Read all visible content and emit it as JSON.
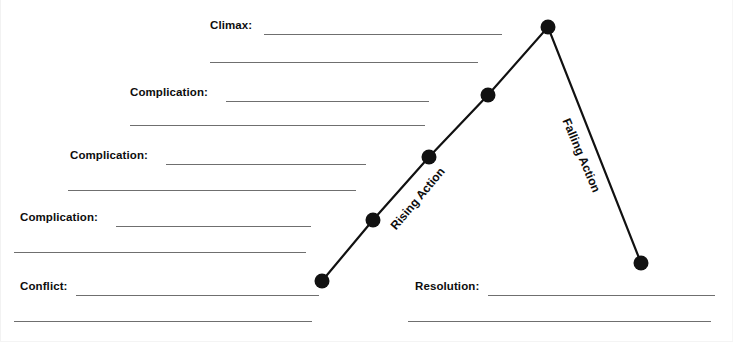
{
  "worksheet": {
    "title": "Plot Diagram Graphic Organizer",
    "background_color": "#ffffff",
    "rule_color": "#6f6f6f",
    "text_color": "#0d0d0d",
    "plot_line_color": "#111111"
  },
  "stages": [
    {
      "id": "climax",
      "label": "Climax:",
      "label_x": 210,
      "label_y": 20,
      "rule1": {
        "x": 264,
        "y": 34,
        "width": 238
      },
      "rule2": {
        "x": 210,
        "y": 62,
        "width": 268
      }
    },
    {
      "id": "complication-3",
      "label": "Complication:",
      "label_x": 130,
      "label_y": 87,
      "rule1": {
        "x": 226,
        "y": 101,
        "width": 203
      },
      "rule2": {
        "x": 130,
        "y": 125,
        "width": 295
      }
    },
    {
      "id": "complication-2",
      "label": "Complication:",
      "label_x": 70,
      "label_y": 150,
      "rule1": {
        "x": 166,
        "y": 164,
        "width": 200
      },
      "rule2": {
        "x": 68,
        "y": 190,
        "width": 288
      }
    },
    {
      "id": "complication-1",
      "label": "Complication:",
      "label_x": 20,
      "label_y": 212,
      "rule1": {
        "x": 116,
        "y": 226,
        "width": 195
      },
      "rule2": {
        "x": 14,
        "y": 252,
        "width": 292
      }
    },
    {
      "id": "conflict",
      "label": "Conflict:",
      "label_x": 20,
      "label_y": 281,
      "rule1": {
        "x": 76,
        "y": 295,
        "width": 243
      },
      "rule2": {
        "x": 14,
        "y": 321,
        "width": 298
      }
    },
    {
      "id": "resolution",
      "label": "Resolution:",
      "label_x": 415,
      "label_y": 281,
      "rule1": {
        "x": 488,
        "y": 295,
        "width": 227
      },
      "rule2": {
        "x": 408,
        "y": 321,
        "width": 303
      }
    }
  ],
  "action_labels": [
    {
      "id": "rising-action",
      "text": "Rising Action",
      "x": 393,
      "y": 222,
      "rotation_deg": -50
    },
    {
      "id": "falling-action",
      "text": "Falling Action",
      "x": 566,
      "y": 113,
      "rotation_deg": 67
    }
  ],
  "chart_data": {
    "type": "line",
    "xlabel": "",
    "ylabel": "",
    "grid": false,
    "legend": "none",
    "annotations": [
      "Rising Action",
      "Falling Action"
    ],
    "points": [
      {
        "name": "Conflict",
        "x": 322,
        "y": 281
      },
      {
        "name": "Complication 1",
        "x": 373,
        "y": 220
      },
      {
        "name": "Complication 2",
        "x": 429,
        "y": 157
      },
      {
        "name": "Complication 3",
        "x": 488,
        "y": 95
      },
      {
        "name": "Climax",
        "x": 548,
        "y": 27
      },
      {
        "name": "Resolution",
        "x": 641,
        "y": 263
      }
    ],
    "marker_radius": 7.5,
    "line_width": 2.2
  }
}
